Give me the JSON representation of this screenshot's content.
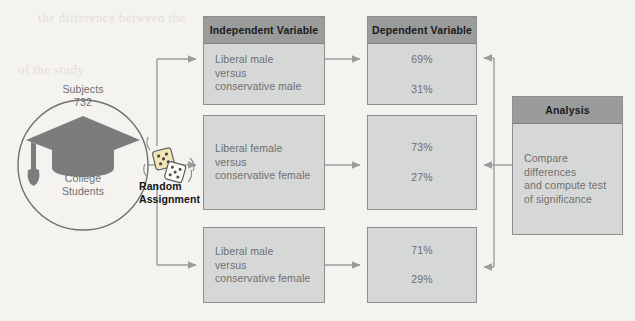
{
  "diagram": {
    "background_color": "#f5f3f0",
    "header_color": "#9a9b9b",
    "body_color": "#d6d7d7",
    "border_color": "#8d8e8e",
    "text_color": "#6e6f70"
  },
  "subjects": {
    "label_top": "Subjects",
    "count": "732",
    "label_bottom_line1": "College",
    "label_bottom_line2": "Students",
    "icon": "graduation-cap-icon"
  },
  "random_assignment": {
    "line1": "Random",
    "line2": "Assignment",
    "icon": "dice-icon"
  },
  "columns": {
    "independent": {
      "header": "Independent Variable"
    },
    "dependent": {
      "header": "Dependent Variable"
    }
  },
  "rows": [
    {
      "independent": {
        "line1": "Liberal male",
        "line2": "versus",
        "line3": "conservative male"
      },
      "dependent": {
        "pct1": "69%",
        "pct2": "31%"
      }
    },
    {
      "independent": {
        "line1": "Liberal female",
        "line2": "versus",
        "line3": "conservative female"
      },
      "dependent": {
        "pct1": "73%",
        "pct2": "27%"
      }
    },
    {
      "independent": {
        "line1": "Liberal male",
        "line2": "versus",
        "line3": "conservative female"
      },
      "dependent": {
        "pct1": "71%",
        "pct2": "29%"
      }
    }
  ],
  "analysis": {
    "header": "Analysis",
    "line1": "Compare differences",
    "line2": "and compute test",
    "line3": "of significance"
  },
  "bleed_through": {
    "block_a": "the difference between the",
    "block_b": "of the study"
  }
}
